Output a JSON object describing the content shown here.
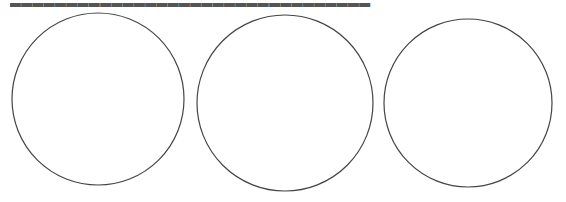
{
  "document": {
    "top_text": {
      "content": "▂▂▂▂▂▂▂▂▂▂▂▂▂▂▂▂▂▂▂▂▂▂▂▂▂▂▂▂▂▂▂▂",
      "note": "Line of Chinese text clipped at top edge; glyphs unreadable"
    },
    "figure": {
      "stroke_color": "#444444",
      "background": "#ffffff",
      "circles": [
        {
          "label": "circle-1",
          "cx": 98,
          "cy": 99,
          "r": 86
        },
        {
          "label": "circle-2",
          "cx": 285,
          "cy": 103,
          "r": 88
        },
        {
          "label": "circle-3",
          "cx": 468,
          "cy": 103,
          "r": 84
        }
      ]
    }
  }
}
